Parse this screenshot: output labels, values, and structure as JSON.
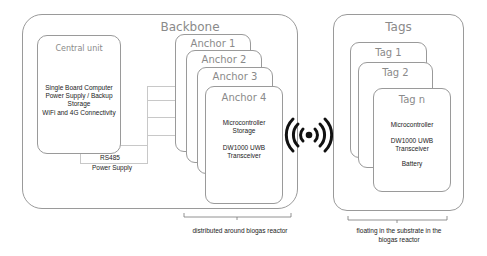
{
  "backbone": {
    "title": "Backbone",
    "central_unit": {
      "title": "Central unit",
      "lines": [
        "Single Board Computer",
        "Power Supply / Backup",
        "Storage",
        "WiFi and 4G Connectivity"
      ]
    },
    "connection_labels": [
      "RS485",
      "Power Supply"
    ],
    "anchors": [
      {
        "title": "Anchor 1"
      },
      {
        "title": "Anchor 2"
      },
      {
        "title": "Anchor 3"
      },
      {
        "title": "Anchor 4",
        "lines_a": [
          "Microcontroller",
          "Storage"
        ],
        "lines_b": [
          "DW1000 UWB",
          "Transceiver"
        ]
      }
    ],
    "caption": "distributed around biogas reactor"
  },
  "wireless_icon": "wireless-signal-icon",
  "tags": {
    "title": "Tags",
    "items": [
      {
        "title": "Tag 1"
      },
      {
        "title": "Tag 2"
      },
      {
        "title": "Tag n",
        "lines_a": [
          "Microcontroller"
        ],
        "lines_b": [
          "DW1000 UWB",
          "Transceiver"
        ],
        "lines_c": [
          "Battery"
        ]
      }
    ],
    "caption_lines": [
      "floating in the substrate in the",
      "biogas reactor"
    ]
  },
  "colors": {
    "border": "#9a9a9a",
    "title_text": "#8a8a8a",
    "body_text": "#222222",
    "icon": "#111111",
    "connector": "#c8c8c8"
  }
}
